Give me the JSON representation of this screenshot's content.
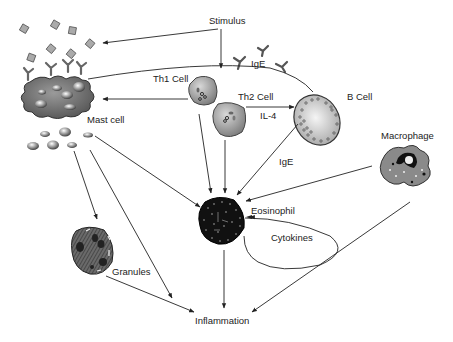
{
  "diagram": {
    "type": "immune-pathway",
    "nodes": {
      "stimulus": "Stimulus",
      "ige_top": "IgE",
      "th1": "Th1 Cell",
      "th2": "Th2 Cell",
      "il4": "IL-4",
      "bcell": "B Cell",
      "ige_mid": "IgE",
      "mast": "Mast cell",
      "macrophage": "Macrophage",
      "eosinophil": "Eosinophil",
      "cytokines": "Cytokines",
      "granules": "Granules",
      "inflammation": "Inflammation"
    },
    "edges": [
      {
        "from": "Stimulus",
        "to": "Mast cell antigens"
      },
      {
        "from": "Stimulus",
        "to": "Th1 Cell"
      },
      {
        "from": "Th1 Cell",
        "to": "Mast cell"
      },
      {
        "from": "Th2 Cell",
        "to": "B Cell",
        "label": "IL-4"
      },
      {
        "from": "B Cell",
        "to": "Mast cell",
        "label": "IgE"
      },
      {
        "from": "B Cell",
        "to": "Eosinophil",
        "label": "IgE"
      },
      {
        "from": "Th1 Cell",
        "to": "Eosinophil"
      },
      {
        "from": "Th2 Cell",
        "to": "Eosinophil"
      },
      {
        "from": "Macrophage",
        "to": "Eosinophil"
      },
      {
        "from": "Macrophage",
        "to": "Inflammation"
      },
      {
        "from": "Mast cell",
        "to": "Eosinophil"
      },
      {
        "from": "Mast cell",
        "to": "Granules"
      },
      {
        "from": "Mast cell",
        "to": "Inflammation"
      },
      {
        "from": "Granules",
        "to": "Inflammation"
      },
      {
        "from": "Eosinophil",
        "to": "Inflammation"
      },
      {
        "from": "Eosinophil",
        "to": "Eosinophil",
        "label": "Cytokines"
      }
    ]
  },
  "colors": {
    "line": "#222222",
    "cell_gray": "#8a8a8a",
    "cell_dark": "#111111",
    "cell_light": "#cfcfcf"
  }
}
